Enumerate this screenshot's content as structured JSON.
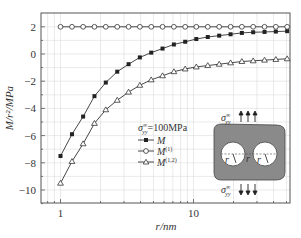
{
  "chart_data": {
    "type": "line",
    "title": "",
    "xlabel": "r/nm",
    "ylabel": "M/r²/MPa",
    "xscale": "log",
    "xlim": [
      0.75,
      75
    ],
    "ylim": [
      -11,
      2.9
    ],
    "grid": true,
    "x_ticks": [
      {
        "value": 1,
        "label": "1"
      },
      {
        "value": 10,
        "label": "10"
      }
    ],
    "y_ticks": [
      {
        "value": 2,
        "label": "2"
      },
      {
        "value": 0,
        "label": "0"
      },
      {
        "value": -2,
        "label": "−2"
      },
      {
        "value": -4,
        "label": "−4"
      },
      {
        "value": -6,
        "label": "−6"
      },
      {
        "value": -8,
        "label": "−8"
      },
      {
        "value": -10,
        "label": "−10"
      }
    ],
    "x": [
      1.0,
      1.22,
      1.48,
      1.8,
      2.19,
      2.67,
      3.25,
      3.95,
      4.81,
      5.85,
      7.12,
      8.66,
      10.5,
      12.8,
      15.6,
      19.0,
      23.1,
      28.1,
      34.2,
      41.6,
      50.6
    ],
    "series": [
      {
        "name": "M",
        "marker": "filled-square",
        "values": [
          -7.5,
          -5.9,
          -4.6,
          -3.1,
          -2.1,
          -1.3,
          -0.75,
          -0.25,
          0.1,
          0.4,
          0.7,
          0.9,
          1.1,
          1.25,
          1.35,
          1.45,
          1.55,
          1.6,
          1.62,
          1.65,
          1.68
        ]
      },
      {
        "name": "M(1)",
        "marker": "open-circle",
        "values": [
          2.0,
          2.0,
          2.0,
          2.0,
          2.0,
          2.0,
          2.0,
          2.0,
          2.0,
          2.0,
          2.0,
          2.0,
          2.0,
          2.0,
          2.0,
          2.0,
          2.0,
          2.0,
          2.0,
          2.0,
          2.0
        ]
      },
      {
        "name": "M(1,2)",
        "marker": "open-triangle",
        "values": [
          -9.5,
          -7.9,
          -6.6,
          -5.1,
          -4.1,
          -3.4,
          -2.8,
          -2.3,
          -1.9,
          -1.6,
          -1.3,
          -1.1,
          -0.95,
          -0.85,
          -0.75,
          -0.65,
          -0.55,
          -0.5,
          -0.45,
          -0.4,
          -0.35
        ]
      }
    ],
    "legend": {
      "position": "lower-center",
      "title": "σ∞yy=100MPa",
      "title_main": "σ",
      "title_sup": "∞",
      "title_sub": "yy",
      "title_value": "=100MPa",
      "entries": [
        {
          "label": "M",
          "sup": ""
        },
        {
          "label": "M",
          "sup": "(1)"
        },
        {
          "label": "M",
          "sup": "(1,2)"
        }
      ]
    },
    "annotations": {
      "inset": "plate with two circular holes of radius r, separation r, under remote tension σ∞yy",
      "stress_label_main": "σ",
      "stress_label_sup": "∞",
      "stress_label_sub": "yy",
      "radius_label": "r",
      "gap_label": "r"
    }
  },
  "colors": {
    "line": "#333333",
    "grid": "#dcdcdc",
    "frame": "#555555",
    "inset_fill": "#8a8a8a",
    "inset_hole": "#ffffff"
  }
}
